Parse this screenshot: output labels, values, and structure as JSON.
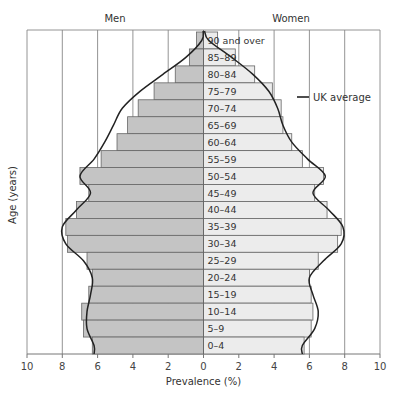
{
  "chart_data": {
    "type": "bar",
    "subtype": "population-pyramid",
    "title": "",
    "left_series_title": "Men",
    "right_series_title": "Women",
    "xlabel": "Prevalence (%)",
    "ylabel": "Age (years)",
    "xlim": [
      0,
      10
    ],
    "x_ticks_left": [
      "10",
      "8",
      "6",
      "4",
      "2",
      "0"
    ],
    "x_ticks_right": [
      "2",
      "4",
      "6",
      "8",
      "10"
    ],
    "grid": true,
    "legend": [
      {
        "label": "UK average",
        "style": "line",
        "color": "#222222"
      }
    ],
    "legend_position": "right-upper",
    "categories": [
      "90 and over",
      "85–89",
      "80–84",
      "75–79",
      "70–74",
      "65–69",
      "60–64",
      "55–59",
      "50–54",
      "45–49",
      "40–44",
      "35–39",
      "30–34",
      "25–29",
      "20–24",
      "15–19",
      "10–14",
      "5–9",
      "0–4"
    ],
    "series": [
      {
        "name": "Men",
        "color": "#c4c4c4",
        "values": [
          0.4,
          0.8,
          1.6,
          2.8,
          3.7,
          4.3,
          4.9,
          5.8,
          7.0,
          6.5,
          7.2,
          7.8,
          7.7,
          6.6,
          6.3,
          6.5,
          6.9,
          6.8,
          6.3
        ]
      },
      {
        "name": "Women",
        "color": "#ececec",
        "values": [
          0.8,
          1.8,
          2.9,
          3.9,
          4.4,
          4.5,
          5.0,
          5.6,
          6.8,
          6.3,
          7.0,
          7.8,
          7.6,
          6.5,
          6.0,
          6.1,
          6.2,
          6.1,
          5.7
        ]
      },
      {
        "name": "UK average (Men)",
        "type": "line",
        "values": [
          0.1,
          1.0,
          2.3,
          3.6,
          4.6,
          5.1,
          5.6,
          6.2,
          7.0,
          6.4,
          7.2,
          8.0,
          7.8,
          6.8,
          6.3,
          6.4,
          6.6,
          6.6,
          6.2
        ]
      },
      {
        "name": "UK average (Women)",
        "type": "line",
        "values": [
          0.3,
          1.6,
          2.8,
          3.7,
          4.2,
          4.5,
          5.0,
          5.9,
          6.9,
          6.2,
          7.1,
          7.9,
          7.8,
          6.8,
          6.0,
          6.2,
          6.5,
          6.3,
          5.6
        ]
      }
    ]
  }
}
